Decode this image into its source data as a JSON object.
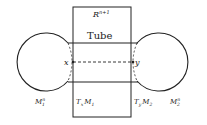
{
  "diagram": {
    "space_label": "R",
    "space_sup": "n+1",
    "tube_label": "Tube",
    "point_x": "x",
    "point_y": "y",
    "manifold1": {
      "base": "M",
      "sub": "1",
      "sup": "n"
    },
    "manifold2": {
      "base": "M",
      "sub": "2",
      "sup": "n"
    },
    "tangent1": {
      "T": "T",
      "tsub": "x",
      "M": "M",
      "msub": "1"
    },
    "tangent2": {
      "T": "T",
      "tsub": "y",
      "M": "M",
      "msub": "2"
    },
    "stroke_color": "#222222"
  }
}
